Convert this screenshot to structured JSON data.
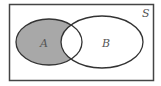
{
  "diagram": {
    "type": "venn",
    "universe_label": "S",
    "sets": [
      {
        "label": "A",
        "shaded": true
      },
      {
        "label": "B",
        "shaded": false
      }
    ],
    "shaded_region": "A minus B",
    "colors": {
      "shade": "#a8a8a8",
      "stroke": "#333333",
      "background": "#ffffff",
      "label": "#555555"
    }
  }
}
